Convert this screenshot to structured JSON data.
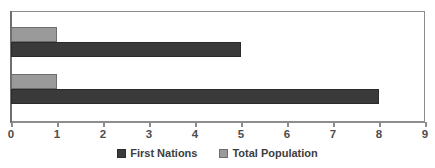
{
  "chart_data": {
    "type": "bar",
    "orientation": "horizontal",
    "title": "",
    "xlabel": "",
    "ylabel": "",
    "xlim": [
      0,
      9
    ],
    "xticks": [
      0,
      1,
      2,
      3,
      4,
      5,
      6,
      7,
      8,
      9
    ],
    "xtick_labels": [
      "0",
      "1",
      "2",
      "3",
      "4",
      "5",
      "6",
      "7",
      "8",
      "9"
    ],
    "categories": [
      "",
      ""
    ],
    "ytick_labels": [],
    "grid": false,
    "legend_position": "bottom-center",
    "series": [
      {
        "name": "First Nations",
        "color": "#3a3a3a",
        "values": [
          5,
          8
        ]
      },
      {
        "name": "Total Population",
        "color": "#9a9a9a",
        "values": [
          1,
          1
        ]
      }
    ]
  },
  "legend": {
    "items": [
      {
        "label": "First Nations",
        "swatch": "series-first-nations"
      },
      {
        "label": "Total Population",
        "swatch": "series-total-population"
      }
    ]
  },
  "axis": {
    "tick_labels": [
      "0",
      "1",
      "2",
      "3",
      "4",
      "5",
      "6",
      "7",
      "8",
      "9"
    ]
  },
  "colors": {
    "first_nations": "#3a3a3a",
    "total_population": "#9a9a9a",
    "frame": "#8d8d8d",
    "axis": "#6f6f6f",
    "text": "#4d4d4d",
    "background": "#ffffff"
  }
}
